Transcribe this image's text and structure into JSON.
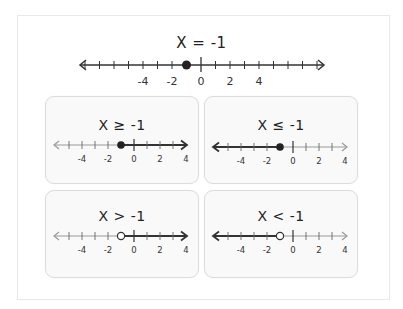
{
  "main": {
    "title": "X = -1",
    "point": -1,
    "point_style": "closed",
    "tick_labels": [
      "-4",
      "-2",
      "0",
      "2",
      "4"
    ]
  },
  "cards": [
    {
      "title": "X ≥ -1",
      "point": -1,
      "point_style": "closed",
      "direction": "right",
      "tick_labels": [
        "-4",
        "-2",
        "0",
        "2",
        "4"
      ]
    },
    {
      "title": "X ≤ -1",
      "point": -1,
      "point_style": "closed",
      "direction": "left",
      "tick_labels": [
        "-4",
        "-2",
        "0",
        "2",
        "4"
      ]
    },
    {
      "title": "X > -1",
      "point": -1,
      "point_style": "open",
      "direction": "right",
      "tick_labels": [
        "-4",
        "-2",
        "0",
        "2",
        "4"
      ]
    },
    {
      "title": "X < -1",
      "point": -1,
      "point_style": "open",
      "direction": "left",
      "tick_labels": [
        "-4",
        "-2",
        "0",
        "2",
        "4"
      ]
    }
  ],
  "colors": {
    "line_dark": "#333333",
    "line_light": "#999999",
    "card_bg": "#f9f9f9",
    "card_border": "#dcdcdc"
  }
}
